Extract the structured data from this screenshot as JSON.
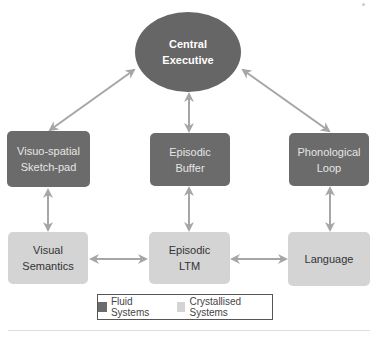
{
  "diagram": {
    "central": {
      "label_line1": "Central",
      "label_line2": "Executive"
    },
    "fluid_boxes": [
      {
        "line1": "Visuo-spatial",
        "line2": "Sketch-pad"
      },
      {
        "line1": "Episodic",
        "line2": "Buffer"
      },
      {
        "line1": "Phonological",
        "line2": "Loop"
      }
    ],
    "crystallised_boxes": [
      {
        "line1": "Visual",
        "line2": "Semantics"
      },
      {
        "line1": "Episodic",
        "line2": "LTM"
      },
      {
        "line1": "Language",
        "line2": ""
      }
    ],
    "legend": {
      "fluid_label": "Fluid Systems",
      "crystallised_label": "Crystallised Systems"
    },
    "colors": {
      "central": "#666666",
      "fluid": "#6b6b6b",
      "crystallised": "#d4d4d4",
      "arrow": "#a6a6a6"
    }
  }
}
